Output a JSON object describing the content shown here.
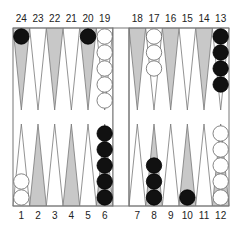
{
  "board": {
    "colors": {
      "shaded_point": "#c8c8c8",
      "light_point": "#ffffff",
      "line": "#777777",
      "black_checker": "#111111",
      "white_checker": "#ffffff"
    },
    "top_labels": [
      "24",
      "23",
      "22",
      "21",
      "20",
      "19",
      "18",
      "17",
      "16",
      "15",
      "14",
      "13"
    ],
    "bottom_labels": [
      "1",
      "2",
      "3",
      "4",
      "5",
      "6",
      "7",
      "8",
      "9",
      "10",
      "11",
      "12"
    ],
    "points": [
      {
        "point": 1,
        "color": "white",
        "count": 2
      },
      {
        "point": 6,
        "color": "black",
        "count": 5
      },
      {
        "point": 8,
        "color": "black",
        "count": 3
      },
      {
        "point": 10,
        "color": "black",
        "count": 1
      },
      {
        "point": 12,
        "color": "white",
        "count": 5
      },
      {
        "point": 13,
        "color": "black",
        "count": 4
      },
      {
        "point": 17,
        "color": "white",
        "count": 3
      },
      {
        "point": 19,
        "color": "white",
        "count": 5
      },
      {
        "point": 20,
        "color": "black",
        "count": 1
      },
      {
        "point": 24,
        "color": "black",
        "count": 1
      }
    ]
  }
}
